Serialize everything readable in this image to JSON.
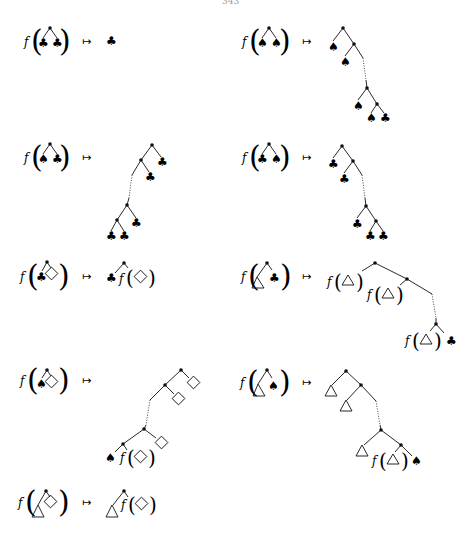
{
  "page": {
    "number": "343"
  },
  "symbols": {
    "function": "f",
    "maps_to": "↦",
    "club": "♣",
    "spade": "♠",
    "open_paren": "(",
    "close_paren": ")"
  },
  "rules": [
    {
      "id": 1,
      "input": "f(node(♣, ♣))",
      "output": "♣"
    },
    {
      "id": 2,
      "input": "f(node(♠, ♠))",
      "output": "right comb: ♠ … ♠ ♣"
    },
    {
      "id": 3,
      "input": "f(node(♠, ♣))",
      "output": "left comb: ♣ … ♣ ♣"
    },
    {
      "id": 4,
      "input": "f(node(♣, ♠))",
      "output": "right comb: ♣ … ♣ ♣"
    },
    {
      "id": 5,
      "input": "f(node(♣, ◇))",
      "output": "node(♣, f(◇))"
    },
    {
      "id": 6,
      "input": "f(node(△, ♣))",
      "output": "right comb: f(△) … f(△) ♣"
    },
    {
      "id": 7,
      "input": "f(node(♠, ◇))",
      "output": "left comb: ◇ … ♠ f(◇)"
    },
    {
      "id": 8,
      "input": "f(node(△, ♠))",
      "output": "right comb: △ … △ f(△) ♠"
    },
    {
      "id": 9,
      "input": "f(node(△, ◇))",
      "output": "node(△, f(◇))"
    }
  ]
}
